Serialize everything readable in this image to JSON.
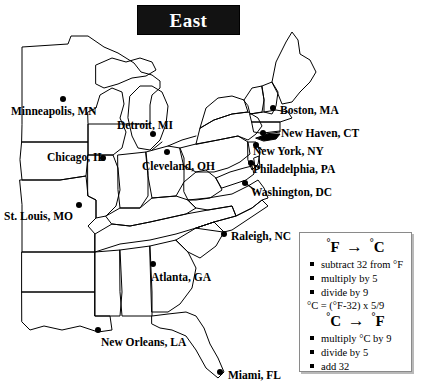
{
  "title": {
    "text": "East"
  },
  "map": {
    "cities": [
      {
        "name": "Minneapolis, MN",
        "dot": [
          63,
          99
        ],
        "label": [
          11,
          106
        ],
        "leader": null
      },
      {
        "name": "Detroit, MI",
        "dot": [
          153,
          134
        ],
        "label": [
          117,
          120
        ],
        "leader": null
      },
      {
        "name": "Chicago, IL",
        "dot": [
          103,
          158
        ],
        "label": [
          47,
          152
        ],
        "leader": null
      },
      {
        "name": "Cleveland, OH",
        "dot": [
          167,
          152
        ],
        "label": [
          142,
          161
        ],
        "leader": null
      },
      {
        "name": "St. Louis, MO",
        "dot": [
          79,
          205
        ],
        "label": [
          4,
          211
        ],
        "leader": null
      },
      {
        "name": "Boston, MA",
        "dot": [
          273,
          108
        ],
        "label": [
          280,
          105
        ],
        "leader": null
      },
      {
        "name": "New Haven, CT",
        "dot": [
          263,
          133
        ],
        "label": [
          281,
          128
        ],
        "leader": [
          263,
          133,
          280,
          131
        ]
      },
      {
        "name": "New York, NY",
        "dot": [
          256,
          145
        ],
        "label": [
          253,
          146
        ],
        "leader": [
          256,
          145,
          262,
          150
        ]
      },
      {
        "name": "Philadelphia, PA",
        "dot": [
          251,
          163
        ],
        "label": [
          253,
          164
        ],
        "leader": [
          251,
          163,
          259,
          168
        ]
      },
      {
        "name": "Washington, DC",
        "dot": [
          245,
          183
        ],
        "label": [
          251,
          187
        ],
        "leader": [
          245,
          183,
          255,
          190
        ]
      },
      {
        "name": "Raleigh, NC",
        "dot": [
          224,
          234
        ],
        "label": [
          231,
          231
        ],
        "leader": null
      },
      {
        "name": "Atlanta, GA",
        "dot": [
          153,
          264
        ],
        "label": [
          151,
          272
        ],
        "leader": null
      },
      {
        "name": "New Orleans, LA",
        "dot": [
          98,
          330
        ],
        "label": [
          101,
          337
        ],
        "leader": null
      },
      {
        "name": "Miami, FL",
        "dot": [
          220,
          372
        ],
        "label": [
          228,
          370
        ],
        "leader": null
      }
    ]
  },
  "legend": {
    "f_to_c": {
      "heading_from": "F",
      "heading_arrow": "→",
      "heading_to": "C",
      "steps": [
        "subtract 32 from °F",
        "multiply by 5",
        "divide by 9"
      ]
    },
    "formula": "°C = (°F-32) x 5/9",
    "c_to_f": {
      "heading_from": "C",
      "heading_arrow": "→",
      "heading_to": "F",
      "steps": [
        "multiply °C by 9",
        "divide by 5",
        "add 32"
      ]
    }
  },
  "colors": {
    "ink": "#000000",
    "banner_bg": "#121212",
    "banner_text": "#ffffff",
    "legend_border": "#8a8a8a",
    "legend_shadow": "#b9b9b9",
    "paper": "#ffffff"
  }
}
